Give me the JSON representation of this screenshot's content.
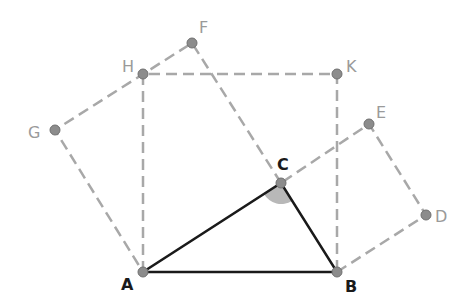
{
  "diagram": {
    "points": {
      "A": {
        "label": "A",
        "x": 143,
        "y": 272
      },
      "B": {
        "label": "B",
        "x": 337,
        "y": 272
      },
      "C": {
        "label": "C",
        "x": 281,
        "y": 183
      },
      "D": {
        "label": "D",
        "x": 426,
        "y": 215
      },
      "E": {
        "label": "E",
        "x": 369,
        "y": 124
      },
      "F": {
        "label": "F",
        "x": 192,
        "y": 43
      },
      "G": {
        "label": "G",
        "x": 55,
        "y": 130
      },
      "H": {
        "label": "H",
        "x": 143,
        "y": 74
      },
      "K": {
        "label": "K",
        "x": 337,
        "y": 74
      }
    },
    "triangle": [
      "A",
      "B",
      "C"
    ],
    "squares": [
      [
        "A",
        "B",
        "K",
        "H"
      ],
      [
        "B",
        "C",
        "E",
        "D"
      ],
      [
        "C",
        "A",
        "G",
        "F"
      ]
    ],
    "angle_marked": "C",
    "colors": {
      "solid": "#1a1a1a",
      "dashed": "#a0a0a0",
      "point": "#8c8c8c",
      "angle": "#b8b8b8",
      "label_dark": "#1a1a1a",
      "label_light": "#9a9a9a"
    }
  }
}
